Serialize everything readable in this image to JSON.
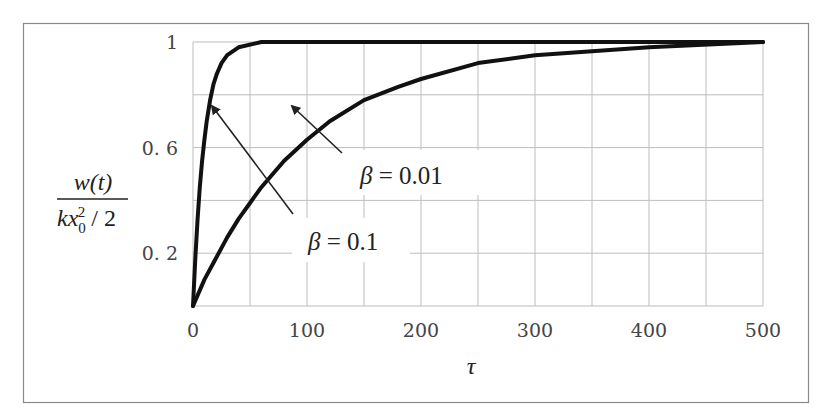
{
  "chart_data": {
    "type": "line",
    "title": "",
    "xlabel": "τ",
    "ylabel": "w(t) / (k x0^2 / 2)",
    "ylabel_parts": {
      "numerator": "w(t)",
      "denominator_k": "kx",
      "denominator_sub": "0",
      "denominator_sup": "2",
      "denominator_tail": " / 2"
    },
    "xlim": [
      0,
      500
    ],
    "ylim": [
      0,
      1.0
    ],
    "x_ticks": [
      0,
      100,
      200,
      300,
      400,
      500
    ],
    "x_tick_labels": [
      "0",
      "100",
      "200",
      "300",
      "400",
      "500"
    ],
    "y_ticks": [
      0.2,
      0.6,
      1.0
    ],
    "y_tick_labels": [
      "0. 2",
      "0. 6",
      "1"
    ],
    "x_grid_step": 50,
    "y_grid_step": 0.2,
    "grid": true,
    "legend": "none (inline arrow annotations)",
    "series": [
      {
        "name": "β = 0.1",
        "x": [
          0,
          2,
          4,
          6,
          8,
          10,
          12,
          15,
          18,
          21,
          25,
          30,
          40,
          60,
          100,
          200,
          300,
          400,
          500
        ],
        "values": [
          0.0,
          0.18,
          0.33,
          0.45,
          0.55,
          0.63,
          0.7,
          0.78,
          0.84,
          0.88,
          0.92,
          0.95,
          0.98,
          1.0,
          1.0,
          1.0,
          1.0,
          1.0,
          1.0
        ]
      },
      {
        "name": "β = 0.01",
        "x": [
          0,
          10,
          20,
          30,
          40,
          50,
          60,
          80,
          100,
          120,
          150,
          180,
          200,
          250,
          300,
          400,
          500
        ],
        "values": [
          0.0,
          0.1,
          0.18,
          0.26,
          0.33,
          0.39,
          0.45,
          0.55,
          0.63,
          0.7,
          0.78,
          0.83,
          0.86,
          0.92,
          0.95,
          0.98,
          1.0
        ]
      }
    ],
    "annotations": [
      {
        "text_greek": "β",
        "text_rest": " = 0.1",
        "label": "β = 0.1",
        "arrow_points_to_series": "β = 0.1"
      },
      {
        "text_greek": "β",
        "text_rest": " = 0.01",
        "label": "β = 0.01",
        "arrow_points_to_series": "β = 0.01"
      }
    ]
  },
  "style": {
    "line_color": "#111111",
    "grid_color": "#bdbdbd",
    "frame_color": "#8a8a8a",
    "text_color": "#444444"
  }
}
